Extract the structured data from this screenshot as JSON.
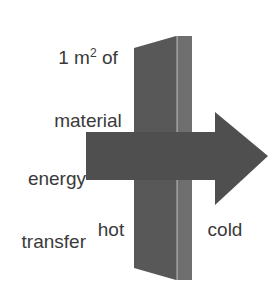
{
  "figure": {
    "background_color": "#ffffff",
    "width": 274,
    "height": 294
  },
  "labels": {
    "material": {
      "line1_prefix": "1 m",
      "line1_superscript": "2",
      "line1_suffix": " of",
      "line2": "material",
      "color": "#3a3a3a"
    },
    "energy": {
      "line1": "energy",
      "line2": "transfer",
      "color": "#3a3a3a"
    },
    "hot": "hot",
    "cold": "cold"
  },
  "shapes": {
    "slab": {
      "name": "material-slab",
      "front_face_color": "#585858",
      "side_face_color": "#6b6b6b",
      "edge_color": "#8a8a8a",
      "front_points": "134,48 176,36 176,280 134,268",
      "side_points": "176,36 192,36 192,280 176,280"
    },
    "arrow": {
      "name": "energy-transfer-arrow",
      "color": "#4f4f4f",
      "shaft_points": "86,132 215,132 215,180 86,180",
      "head_points": "215,112 268,156 215,205"
    }
  },
  "colors": {
    "slab_front": "#585858",
    "slab_side": "#6b6b6b",
    "arrow": "#4f4f4f",
    "text": "#3a3a3a",
    "background": "#ffffff"
  }
}
